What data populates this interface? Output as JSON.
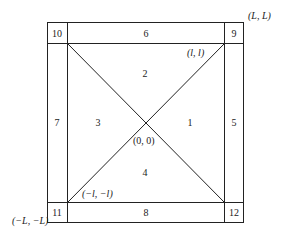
{
  "diagram": {
    "regions": [
      {
        "id": "1",
        "label": "1",
        "x": 190,
        "y": 122
      },
      {
        "id": "2",
        "label": "2",
        "x": 145,
        "y": 77
      },
      {
        "id": "3",
        "label": "3",
        "x": 98,
        "y": 122
      },
      {
        "id": "4",
        "label": "4",
        "x": 145,
        "y": 176
      },
      {
        "id": "5",
        "label": "5",
        "x": 233,
        "y": 122
      },
      {
        "id": "6",
        "label": "6",
        "x": 146,
        "y": 36
      },
      {
        "id": "7",
        "label": "7",
        "x": 57,
        "y": 122
      },
      {
        "id": "8",
        "label": "8",
        "x": 146,
        "y": 215
      },
      {
        "id": "9",
        "label": "9",
        "x": 233,
        "y": 36
      },
      {
        "id": "10",
        "label": "10",
        "x": 57,
        "y": 36
      },
      {
        "id": "11",
        "label": "11",
        "x": 57,
        "y": 215
      },
      {
        "id": "12",
        "label": "12",
        "x": 233,
        "y": 215
      }
    ],
    "coordinates": {
      "outer_top_right": "(L, L)",
      "outer_bottom_left": "(−L, −L)",
      "inner_top_right": "(l, l)",
      "inner_bottom_left": "(−l, −l)",
      "center": "(0, 0)"
    }
  }
}
